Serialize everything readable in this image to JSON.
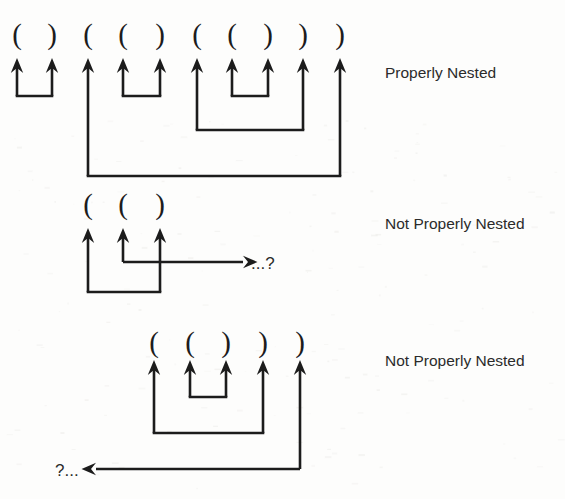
{
  "figure": {
    "background_color": "#fdfdfc",
    "ink_color": "#1c1c1c",
    "groups": [
      {
        "id": "group-1",
        "label": "Properly Nested",
        "label_x": 385,
        "label_y": 78,
        "tokens": [
          "(",
          ")",
          "(",
          "(",
          ")",
          "(",
          "(",
          ")",
          ")",
          ")"
        ],
        "token_x": [
          17,
          52,
          88,
          123,
          160,
          197,
          232,
          268,
          303,
          340
        ],
        "paren_baseline_y": 44,
        "arrow_tip_y": 58,
        "arrow_shaft_x_offset": 0,
        "matches": [
          {
            "from": 0,
            "to": 1,
            "depth_y": 96
          },
          {
            "from": 3,
            "to": 4,
            "depth_y": 96
          },
          {
            "from": 6,
            "to": 7,
            "depth_y": 96
          },
          {
            "from": 5,
            "to": 8,
            "depth_y": 130
          },
          {
            "from": 2,
            "to": 9,
            "depth_y": 176
          }
        ],
        "open_ended": null
      },
      {
        "id": "group-2",
        "label": "Not Properly Nested",
        "label_x": 385,
        "label_y": 229,
        "tokens": [
          "(",
          "(",
          ")"
        ],
        "token_x": [
          88,
          123,
          160
        ],
        "paren_baseline_y": 214,
        "arrow_tip_y": 228,
        "matches": [
          {
            "from": 0,
            "to": 2,
            "depth_y": 292
          }
        ],
        "open_ended": {
          "from_index": 1,
          "direction": "right",
          "depth_y": 262,
          "end_x": 243,
          "text": "...?",
          "text_x": 251,
          "text_y": 269
        }
      },
      {
        "id": "group-3",
        "label": "Not Properly Nested",
        "label_x": 385,
        "label_y": 366,
        "tokens": [
          "(",
          "(",
          ")",
          ")",
          ")"
        ],
        "token_x": [
          154,
          190,
          226,
          263,
          300
        ],
        "paren_baseline_y": 352,
        "arrow_tip_y": 360,
        "matches": [
          {
            "from": 1,
            "to": 2,
            "depth_y": 397
          },
          {
            "from": 0,
            "to": 3,
            "depth_y": 433
          }
        ],
        "open_ended": {
          "from_index": 4,
          "direction": "left",
          "depth_y": 469,
          "end_x": 96,
          "text": "?...",
          "text_x": 55,
          "text_y": 476
        }
      }
    ]
  }
}
